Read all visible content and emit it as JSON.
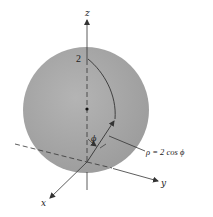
{
  "diagram": {
    "type": "spherical-coordinates-sphere",
    "colors": {
      "sphere_fill": "#a8a8a8",
      "sphere_edge": "#9a9a9a",
      "line": "#333333",
      "background": "#ffffff"
    },
    "axes": {
      "z_label": "z",
      "y_label": "y",
      "x_label": "x"
    },
    "labels": {
      "top_value": "2",
      "angle": "ϕ",
      "equation": "ρ = 2 cos ϕ"
    }
  }
}
